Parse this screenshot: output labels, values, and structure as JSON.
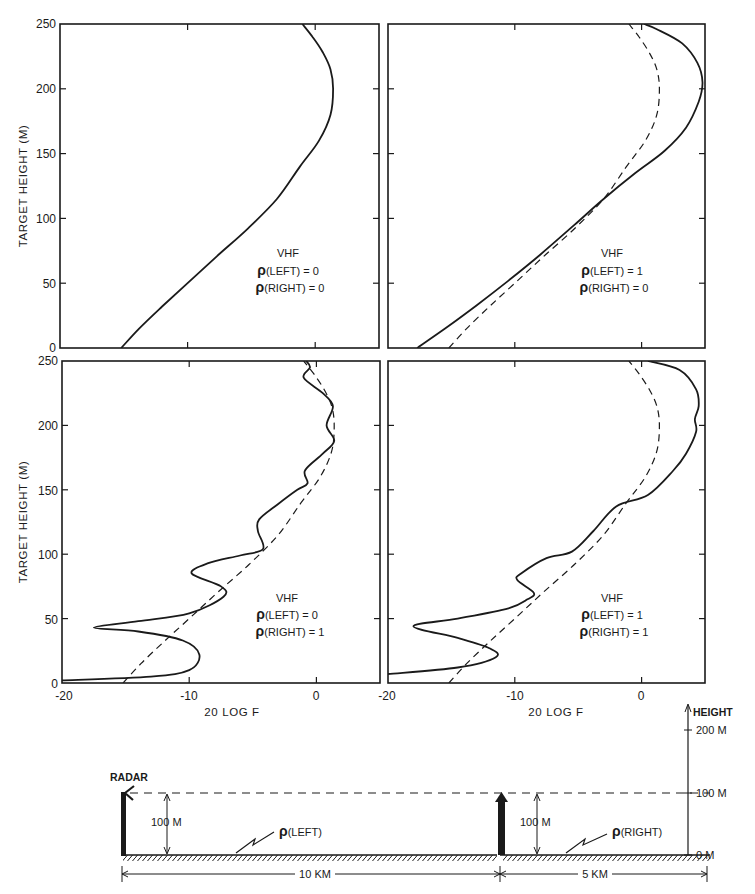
{
  "chart_data": [
    {
      "panel": "top-left",
      "type": "line",
      "annotation": [
        "VHF",
        "ρ(LEFT) = 0",
        "ρ(RIGHT) = 0"
      ],
      "xlabel": "",
      "ylabel": "TARGET HEIGHT (M)",
      "xlim": [
        -20,
        5
      ],
      "ylim": [
        0,
        250
      ],
      "yticks": [
        "0",
        "50",
        "100",
        "150",
        "200",
        "250"
      ],
      "series": [
        {
          "name": "solid",
          "style": "solid",
          "x": [
            -15.2,
            -13.8,
            -12.0,
            -10.0,
            -7.8,
            -5.3,
            -3.0,
            -1.2,
            0.3,
            1.2,
            1.4,
            1.2,
            0.6,
            -0.2,
            -1.0
          ],
          "y": [
            0,
            15,
            32,
            50,
            70,
            92,
            115,
            140,
            160,
            180,
            200,
            215,
            228,
            240,
            250
          ]
        }
      ]
    },
    {
      "panel": "top-right",
      "type": "line",
      "annotation": [
        "VHF",
        "ρ(LEFT) = 1",
        "ρ(RIGHT) = 0"
      ],
      "xlabel": "",
      "ylabel": "",
      "xlim": [
        -20,
        5
      ],
      "ylim": [
        0,
        250
      ],
      "series": [
        {
          "name": "solid",
          "style": "solid",
          "x": [
            -17.7,
            -15.5,
            -13.0,
            -10.5,
            -8.0,
            -5.3,
            -3.0,
            -0.5,
            1.8,
            3.5,
            4.5,
            4.8,
            4.4,
            3.2,
            1.2,
            0.2
          ],
          "y": [
            0,
            15,
            33,
            52,
            72,
            95,
            115,
            135,
            152,
            170,
            190,
            205,
            220,
            235,
            246,
            250
          ]
        },
        {
          "name": "dashed",
          "style": "dashed",
          "x": [
            -15.2,
            -13.8,
            -12.0,
            -10.0,
            -7.8,
            -5.3,
            -3.0,
            -1.2,
            0.3,
            1.2,
            1.4,
            1.2,
            0.6,
            -0.2,
            -1.0
          ],
          "y": [
            0,
            15,
            32,
            50,
            70,
            92,
            115,
            140,
            160,
            180,
            200,
            215,
            228,
            240,
            250
          ]
        }
      ]
    },
    {
      "panel": "bottom-left",
      "type": "line",
      "annotation": [
        "VHF",
        "ρ(LEFT) = 0",
        "ρ(RIGHT) = 1"
      ],
      "xlabel": "20 LOG F",
      "ylabel": "TARGET HEIGHT (M)",
      "xlim": [
        -20,
        5
      ],
      "ylim": [
        0,
        250
      ],
      "xticks": [
        "-20",
        "-10",
        "0"
      ],
      "yticks": [
        "0",
        "50",
        "100",
        "150",
        "200",
        "250"
      ],
      "series": [
        {
          "name": "solid",
          "style": "solid",
          "x": [
            -20.0,
            -13.0,
            -10.0,
            -9.2,
            -10.5,
            -14.0,
            -17.5,
            -14.0,
            -10.0,
            -7.3,
            -7.5,
            -9.8,
            -8.5,
            -6.0,
            -4.2,
            -4.6,
            -4.5,
            -3.0,
            -1.5,
            -0.7,
            -0.9,
            0.5,
            1.4,
            0.8,
            1.3,
            0.5,
            -1.0,
            -0.5,
            -0.8
          ],
          "y": [
            2,
            5,
            10,
            22,
            33,
            40,
            43,
            48,
            54,
            67,
            75,
            85,
            93,
            99,
            104,
            118,
            127,
            139,
            150,
            155,
            165,
            178,
            188,
            200,
            215,
            225,
            237,
            245,
            250
          ]
        },
        {
          "name": "dashed",
          "style": "dashed",
          "x": [
            -15.2,
            -13.8,
            -12.0,
            -10.0,
            -7.8,
            -5.3,
            -3.0,
            -1.2,
            0.3,
            1.2,
            1.4,
            1.2,
            0.6,
            -0.2,
            -1.0
          ],
          "y": [
            0,
            15,
            32,
            50,
            70,
            92,
            115,
            140,
            160,
            180,
            200,
            215,
            228,
            240,
            250
          ]
        }
      ]
    },
    {
      "panel": "bottom-right",
      "type": "line",
      "annotation": [
        "VHF",
        "ρ(LEFT) = 1",
        "ρ(RIGHT) = 1"
      ],
      "xlabel": "20 LOG F",
      "ylabel": "",
      "xlim": [
        -20,
        5
      ],
      "ylim": [
        0,
        250
      ],
      "xticks": [
        "-20",
        "-10",
        "0"
      ],
      "series": [
        {
          "name": "solid",
          "style": "solid",
          "x": [
            -20.0,
            -14.5,
            -11.5,
            -12.0,
            -14.5,
            -18.0,
            -14.5,
            -10.5,
            -9.0,
            -8.5,
            -9.8,
            -9.5,
            -7.5,
            -5.5,
            -3.8,
            -2.0,
            0.5,
            2.5,
            3.5,
            4.3,
            4.2,
            4.5,
            4.3,
            3.0,
            0.5
          ],
          "y": [
            7,
            12,
            20,
            27,
            35,
            44,
            50,
            58,
            65,
            70,
            80,
            85,
            97,
            102,
            118,
            137,
            146,
            165,
            178,
            195,
            205,
            215,
            228,
            243,
            250
          ]
        },
        {
          "name": "dashed",
          "style": "dashed",
          "x": [
            -15.2,
            -13.8,
            -12.0,
            -10.0,
            -7.8,
            -5.3,
            -3.0,
            -1.2,
            0.3,
            1.2,
            1.4,
            1.2,
            0.6,
            -0.2,
            -1.0
          ],
          "y": [
            0,
            15,
            32,
            50,
            70,
            92,
            115,
            140,
            160,
            180,
            200,
            215,
            228,
            240,
            250
          ]
        }
      ]
    }
  ],
  "axes": {
    "ylabel": "TARGET HEIGHT (M)",
    "xlabel": "20 LOG F",
    "yticks": [
      "250",
      "200",
      "150",
      "100",
      "50",
      "0"
    ],
    "xticks": [
      "-20",
      "-10",
      "0"
    ]
  },
  "panels": {
    "top_left": {
      "line1": "VHF",
      "line2": "(LEFT) = 0",
      "line3": "(RIGHT) = 0"
    },
    "top_right": {
      "line1": "VHF",
      "line2": "(LEFT)  = 1",
      "line3": "(RIGHT) = 0"
    },
    "bottom_left": {
      "line1": "VHF",
      "line2": "(LEFT) = 0",
      "line3": "(RIGHT) = 1"
    },
    "bottom_right": {
      "line1": "VHF",
      "line2": "(LEFT) = 1",
      "line3": "(RIGHT) = 1"
    },
    "rho": "ρ"
  },
  "diagram": {
    "radar_label": "RADAR",
    "left_height": "100 M",
    "right_height": "100 M",
    "rho_left": "(LEFT)",
    "rho_right": "(RIGHT)",
    "rho": "ρ",
    "left_distance": "10 KM",
    "right_distance": "5 KM",
    "scale_title": "HEIGHT",
    "scale_200": "200 M",
    "scale_100": "100 M",
    "scale_0": "0 M"
  }
}
